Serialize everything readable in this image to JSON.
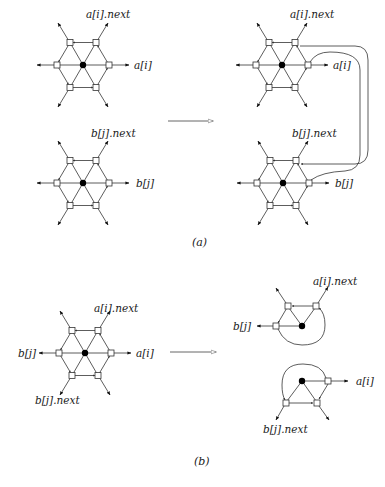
{
  "figure": {
    "header_fragment": "",
    "captions": {
      "a": "(a)",
      "b": "(b)"
    },
    "colors": {
      "line": "#333333",
      "node_fill": "#ffffff",
      "center_fill": "#000000",
      "text": "#1a1a1a"
    }
  },
  "panel_a": {
    "left": {
      "top_graph": {
        "labels": {
          "next": "a[i].next",
          "self": "a[i]"
        },
        "center": [
          83,
          65
        ]
      },
      "bottom_graph": {
        "labels": {
          "next": "b[j].next",
          "self": "b[j]"
        },
        "center": [
          83,
          183
        ]
      }
    },
    "transition_arrow": {
      "from": [
        168,
        121
      ],
      "to": [
        213,
        121
      ]
    },
    "right": {
      "top_graph": {
        "labels": {
          "next": "a[i].next",
          "self": "a[i]"
        },
        "center": [
          282,
          65
        ]
      },
      "bottom_graph": {
        "labels": {
          "next": "b[j].next",
          "self": "b[j]"
        },
        "center": [
          283,
          183
        ]
      }
    }
  },
  "panel_b": {
    "left": {
      "graph": {
        "labels": {
          "next_a": "a[i].next",
          "self_a": "a[i]",
          "self_b": "b[j]",
          "next_b": "b[j].next"
        },
        "center": [
          85,
          353
        ]
      }
    },
    "transition_arrow": {
      "from": [
        170,
        352
      ],
      "to": [
        216,
        352
      ]
    },
    "right": {
      "upper_graph": {
        "labels": {
          "next": "a[i].next",
          "self": "b[j]"
        }
      },
      "lower_graph": {
        "labels": {
          "next": "b[j].next",
          "self": "a[i]"
        }
      }
    }
  }
}
